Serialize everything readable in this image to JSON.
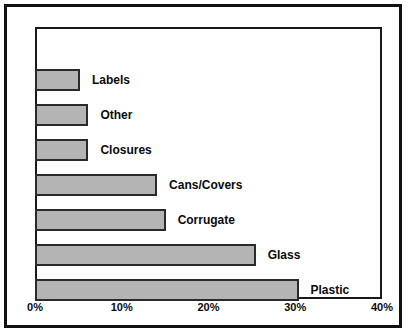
{
  "chart_data": {
    "type": "bar",
    "orientation": "horizontal",
    "title": "",
    "subtitle": "",
    "xlabel": "",
    "ylabel": "",
    "categories": [
      "Labels",
      "Other",
      "Closures",
      "Cans/Covers",
      "Corrugate",
      "Glass",
      "Plastic"
    ],
    "values": [
      5,
      6,
      6,
      14,
      15,
      25.5,
      30.5
    ],
    "value_suffix": "%",
    "xlim": [
      0,
      40
    ],
    "xticks": [
      0,
      10,
      20,
      30,
      40
    ],
    "xtick_labels": [
      "0%",
      "10%",
      "20%",
      "30%",
      "40%"
    ],
    "grid": false,
    "legend": "none",
    "bar_fill_color": "#b4b4b4",
    "bar_border_color": "#2a2a2a",
    "plot_background_color": "#ffffff",
    "frame_color": "#111111",
    "label_placement": "right-of-bar",
    "bars": [
      {
        "category": "Labels",
        "value": 5
      },
      {
        "category": "Other",
        "value": 6
      },
      {
        "category": "Closures",
        "value": 6
      },
      {
        "category": "Cans/Covers",
        "value": 14
      },
      {
        "category": "Corrugate",
        "value": 15
      },
      {
        "category": "Glass",
        "value": 25.5
      },
      {
        "category": "Plastic",
        "value": 30.5
      }
    ]
  }
}
